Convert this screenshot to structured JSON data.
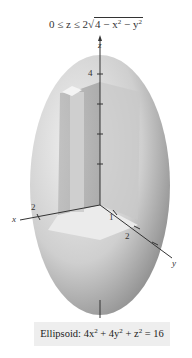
{
  "title_equation": {
    "prefix": "0 ≤ z ≤ 2",
    "radicand": "4 − x",
    "mid": " − y",
    "exp": "2"
  },
  "axes": {
    "z_label": "z",
    "x_label": "x",
    "y_label": "y",
    "z_tick": "4",
    "x_tick": "2",
    "y_tick_1": "1",
    "y_tick_2": "2"
  },
  "caption": {
    "prefix": "Ellipsoid: 4x",
    "mid1": " + 4y",
    "mid2": " + z",
    "suffix": " = 16",
    "exp": "2"
  },
  "colors": {
    "surface_light": "#e4e4e4",
    "surface_dark": "#9a9a9a",
    "caption_bg": "#eeeeee",
    "axis": "#333333"
  }
}
